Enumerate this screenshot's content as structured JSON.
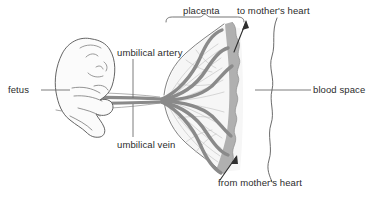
{
  "figure": {
    "type": "anatomical-diagram",
    "background_color": "#ffffff",
    "palette": {
      "outline": "#4a4a4a",
      "vessel": "#8a8a8a",
      "vessel_dark": "#777777",
      "blood_space_fill": "#a9a9a9",
      "placenta_fill": "#f4f4f4",
      "uterus_fill": "#fbfbfb",
      "fetus_fill": "#fafafa",
      "text": "#2b2b2b",
      "leader_line": "#6e6e6e"
    }
  },
  "labels": {
    "fetus": "fetus",
    "umbilical_artery": "umbilical artery",
    "umbilical_vein": "umbilical vein",
    "placenta": "placenta",
    "to_mothers_heart": "to mother's heart",
    "from_mothers_heart": "from mother's heart",
    "blood_space": "blood space"
  },
  "annotations": {
    "brace": {
      "target": "placenta",
      "orientation": "down",
      "span_x": [
        166,
        244
      ],
      "y": 16
    },
    "arrows": [
      {
        "name": "to-mothers-heart-arrow",
        "direction": "up-right",
        "from": [
          236,
          50
        ],
        "to": [
          247,
          22
        ]
      },
      {
        "name": "from-mothers-heart-arrow",
        "direction": "up-right",
        "from": [
          222,
          178
        ],
        "to": [
          236,
          158
        ]
      }
    ],
    "leaders": [
      {
        "name": "fetus-leader",
        "from": [
          40,
          90
        ],
        "to": [
          68,
          90
        ]
      },
      {
        "name": "umbilical-artery-leader",
        "from": [
          133,
          59
        ],
        "to": [
          133,
          99
        ]
      },
      {
        "name": "umbilical-vein-leader",
        "from": [
          133,
          104
        ],
        "to": [
          133,
          137
        ]
      },
      {
        "name": "blood-space-leader",
        "from": [
          310,
          90
        ],
        "to": [
          258,
          90
        ]
      }
    ]
  },
  "structures": [
    {
      "name": "fetus",
      "description": "Curled fetus in profile facing right"
    },
    {
      "name": "umbilical-cord",
      "description": "Cord bundle running right from fetus abdomen"
    },
    {
      "name": "umbilical-artery",
      "description": "Dark vessel looping into placental villi"
    },
    {
      "name": "umbilical-vein",
      "description": "Dark vessel returning from placental villi"
    },
    {
      "name": "placental-villi",
      "description": "Fine branching fronds filling the placenta"
    },
    {
      "name": "blood-space",
      "description": "Grey maternal blood lake against the uterine wall"
    },
    {
      "name": "uterine-wall",
      "description": "Outer wavy outline enclosing the blood space"
    }
  ]
}
